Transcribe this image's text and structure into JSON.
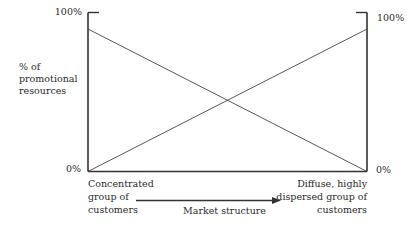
{
  "diagram": {
    "left_axis": {
      "top_label": "100%",
      "bottom_label": "0%",
      "title_lines": [
        "% of",
        "promotional",
        "resources"
      ]
    },
    "right_axis": {
      "top_label": "100%",
      "bottom_label": "0%"
    },
    "x_axis": {
      "left_end_lines": [
        "Concentrated",
        "group of",
        "customers"
      ],
      "right_end_lines": [
        "Diffuse, highly",
        "dispersed group of",
        "customers"
      ],
      "arrow_label": "Market structure"
    },
    "lines": [
      {
        "name": "decreasing",
        "from": "left 100%",
        "to": "right 0%"
      },
      {
        "name": "increasing",
        "from": "left 0%",
        "to": "right 100%"
      }
    ],
    "colors": {
      "line": "#333333",
      "text": "#2a2a2a"
    }
  }
}
